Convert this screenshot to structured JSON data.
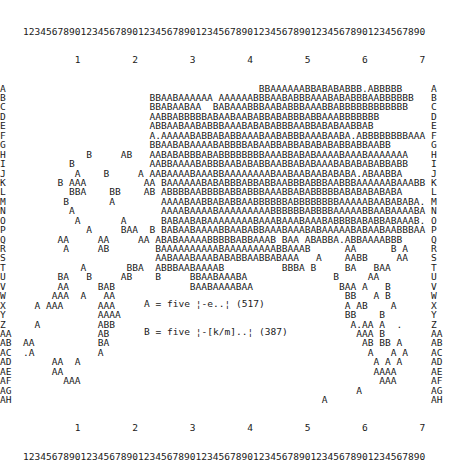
{
  "chart_data": {
    "type": "scatter",
    "title": "",
    "xlabel": "",
    "ylabel": "",
    "x_ruler_units": "1234567890123456789012345678901234567890123456789012345678901234567890",
    "x_ruler_tens": "         1         2         3         4         5         6         7",
    "xlim": [
      1,
      70
    ],
    "y_row_labels": [
      "A",
      "B",
      "C",
      "D",
      "E",
      "F",
      "G",
      "H",
      "I",
      "J",
      "K",
      "L",
      "M",
      "N",
      "O",
      "P",
      "Q",
      "R",
      "S",
      "T",
      "U",
      "V",
      "W",
      "X",
      "Y",
      "Z",
      "AA",
      "AB",
      "AC",
      "AD",
      "AE",
      "AF",
      "AG",
      "AH"
    ],
    "legend": [
      {
        "symbol": "A",
        "label": "A = five ¦-e..¦ (517)",
        "count": 517
      },
      {
        "symbol": "B",
        "label": "B = five ¦-[k/m]..¦ (387)",
        "count": 387
      }
    ],
    "grid": false
  },
  "rows": [
    {
      "label": "A",
      "text": "                                         BBAAAAAABBABABABBB.ABBBBB     "
    },
    {
      "label": "B",
      "text": "                      BBAABAAAAAA AAAAAABBBAABABBBAAABABABBBAABBBBBB    "
    },
    {
      "label": "C",
      "text": "                      BBABAABAA  BABAAABBBAABABBBAAABBABBBBBBBBBBBB   "
    },
    {
      "label": "D",
      "text": "                      AABBABBBBBABAABAABABBABABBBABBAAABBBBBBB         "
    },
    {
      "label": "E",
      "text": "                      ABBAABAABABBBAAABABABABBBAABBABABAABBAB          "
    },
    {
      "label": "F",
      "text": "                      A.AAAAABABBABABBAAABAABABBBAAABAABA.ABBBBBBBBAAAAA"
    },
    {
      "label": "G",
      "text": "                      BBAABABAAAABABBBBABAABBABBABABABABBABBAABB       "
    },
    {
      "label": "H",
      "text": "           B     AB   AABABABBBABABBBBBBBBAAABBABABAAAABAAABAAAAAAA     "
    },
    {
      "label": "I",
      "text": "        B             AABBAAAABABBBAABABABBAABBABABAAABABABABABBABB     "
    },
    {
      "label": "J",
      "text": "         A    B     A AABAAAABAAABBAAAAAAAABAABAABAABABABA.ABAABBA      "
    },
    {
      "label": "K",
      "text": "      B AAA          AA BAAAAAABABABBBABBABBAABBBABBBAABBBAAAAAABAAABB  "
    },
    {
      "label": "L",
      "text": "        BBA    BB    AB ABBBBAABBBBABBABBBAAABBABABBBBBABABABABABA    "
    },
    {
      "label": "M",
      "text": "       B       A        AAAABAABBABABBAABBBBBBABBBBBBBBAAAAABAABABABA.A "
    },
    {
      "label": "N",
      "text": "        A               AAAABAAAABAAAAAAAAABBBBBBABBBBAAAAABBAABAAAABAAA"
    },
    {
      "label": "O",
      "text": "         A       A      BABAABABAAAAAAAABAAABAAABAAABABBBBABABBABAAAB.BAA"
    },
    {
      "label": "P",
      "text": "           A     BAA  B BABAABAAAABBAABABBAAABAAABABAAAAABABAABAABBBAA  "
    },
    {
      "label": "Q",
      "text": "      AA     AA     AA ABABAAAAABBBBBABBAAAB BAA ABABBA.ABBAAAABBB     "
    },
    {
      "label": "R",
      "text": "       A     AB        BAAAAAAAAAABAAAAAAAAABBAAAB      AA      B A    "
    },
    {
      "label": "S",
      "text": "                       AABAAABAAABABABBAABBABAAA   A    AABB     AA    "
    },
    {
      "label": "T",
      "text": "          A       BBA  ABBBAABAAAAB          BBBA B     BA   BAA       "
    },
    {
      "label": "U",
      "text": "      BA   B     AB    B     BBAABAAABA               B     AA        "
    },
    {
      "label": "V",
      "text": "      AA     BAB             BAABAAAABAA               BAA A   B       "
    },
    {
      "label": "W",
      "text": "     AAA  A   AA                                        BB   A B       "
    },
    {
      "label": "X",
      "text": "  A AAA      AAA                                        A AB    A      "
    },
    {
      "label": "Y",
      "text": "             AAAA                                       BB    B        "
    },
    {
      "label": "Z",
      "text": "  A          ABB                                         A.AA A  .     "
    },
    {
      "label": "AA",
      "text": "             AB                                           AAA B        "
    },
    {
      "label": "AB",
      "text": "AA           BA                                            AB BB A     "
    },
    {
      "label": "AC",
      "text": ".A           A                                              A   A A     "
    },
    {
      "label": "AD",
      "text": "     AA  A                                                   A A A     "
    },
    {
      "label": "AE",
      "text": "     AA                                                      AAAA     "
    },
    {
      "label": "AF",
      "text": "       AAA                                                    AAA     "
    },
    {
      "label": "AG",
      "text": "                                                          A           "
    },
    {
      "label": "AH",
      "text": "                                                    A                 "
    }
  ]
}
